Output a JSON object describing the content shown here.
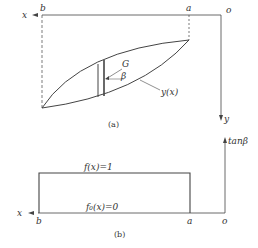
{
  "panel_a": {
    "caption": "(a)",
    "x_axis_label": "x",
    "y_axis_label": "y",
    "origin_label": "o",
    "point_b": "b",
    "point_a": "a",
    "angle_label": "β",
    "point_label": "G",
    "curve_label": "y(x)"
  },
  "panel_b": {
    "caption": "(b)",
    "x_axis_label": "x",
    "y_axis_label": "tanβ",
    "origin_label": "o",
    "point_b": "b",
    "point_a": "a",
    "upper_label": "f(x)=1",
    "lower_label": "f₀(x)=0"
  }
}
